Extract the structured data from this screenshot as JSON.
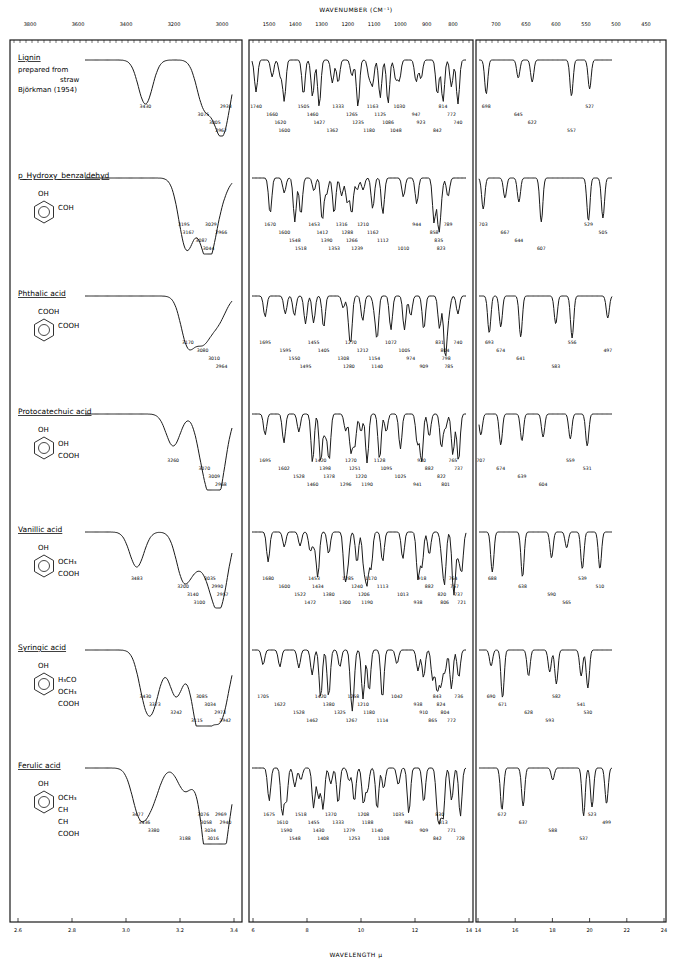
{
  "header": {
    "top_axis_title": "WAVENUMBER (CM⁻¹)",
    "bottom_axis_title": "WAVELENGTH μ"
  },
  "colors": {
    "ink": "#1a1a1a",
    "paper": "#ffffff"
  },
  "chart_data": {
    "type": "line",
    "xlabel": "WAVELENGTH μ",
    "x2label": "WAVENUMBER (CM⁻¹)",
    "ylabel": "",
    "grid": false,
    "legend": "none",
    "panels": [
      {
        "id": "p1",
        "xrange_um": [
          2.4,
          3.45
        ],
        "bottom_ticks": [
          "2.6",
          "2.8",
          "3.0",
          "3.2",
          "3.4"
        ],
        "top_ticks": [
          "3800",
          "3600",
          "3400",
          "3200",
          "3000"
        ]
      },
      {
        "id": "p2",
        "xrange_um": [
          5.6,
          14
        ],
        "bottom_ticks": [
          "6",
          "8",
          "10",
          "12",
          "14"
        ],
        "top_ticks": [
          "1500",
          "1400",
          "1300",
          "1200",
          "1100",
          "1000",
          "900",
          "800"
        ]
      },
      {
        "id": "p3",
        "xrange_um": [
          14,
          24
        ],
        "bottom_ticks": [
          "14",
          "16",
          "18",
          "20",
          "22",
          "24"
        ],
        "top_ticks": [
          "700",
          "650",
          "600",
          "550",
          "500",
          "450"
        ]
      }
    ],
    "series": [
      {
        "name": "Lignin",
        "subtitle": [
          "prepared from",
          "straw",
          "Björkman  (1954)"
        ],
        "formula": [],
        "peaks_p1": [
          3430,
          3075,
          3005,
          2967,
          2938
        ],
        "peaks_p2": [
          1740,
          1660,
          1620,
          1600,
          1505,
          1460,
          1427,
          1362,
          1333,
          1265,
          1235,
          1180,
          1163,
          1125,
          1086,
          1048,
          1030,
          947,
          923,
          842,
          814,
          772,
          740
        ],
        "peaks_p3": [
          698,
          645,
          622,
          557,
          527
        ]
      },
      {
        "name": "p_Hydroxy_benzaldehyd",
        "formula": [
          "OH",
          "COH"
        ],
        "peaks_p1": [
          3195,
          3167,
          3087,
          3044,
          3029,
          2966
        ],
        "peaks_p2": [
          1670,
          1600,
          1548,
          1518,
          1453,
          1412,
          1390,
          1353,
          1316,
          1288,
          1266,
          1239,
          1210,
          1162,
          1112,
          1010,
          944,
          858,
          835,
          823,
          789
        ],
        "peaks_p3": [
          703,
          667,
          644,
          607,
          529,
          505
        ]
      },
      {
        "name": "Phthalic acid",
        "formula": [
          "COOH",
          "COOH"
        ],
        "peaks_p1": [
          3170,
          3080,
          3010,
          2964
        ],
        "peaks_p2": [
          1695,
          1595,
          1550,
          1495,
          1455,
          1405,
          1308,
          1280,
          1270,
          1212,
          1154,
          1140,
          1072,
          1005,
          974,
          909,
          831,
          804,
          798,
          785,
          740
        ],
        "peaks_p3": [
          693,
          674,
          641,
          583,
          556,
          497
        ]
      },
      {
        "name": "Protocatechuic acid",
        "formula": [
          "OH",
          "OH",
          "COOH"
        ],
        "peaks_p1": [
          3260,
          3070,
          3009,
          2968
        ],
        "peaks_p2": [
          1695,
          1602,
          1528,
          1460,
          1420,
          1398,
          1378,
          1296,
          1270,
          1251,
          1220,
          1190,
          1128,
          1095,
          1025,
          941,
          920,
          882,
          822,
          801,
          765,
          737
        ],
        "peaks_p3": [
          707,
          674,
          639,
          604,
          559,
          531
        ]
      },
      {
        "name": "Vanillic acid",
        "formula": [
          "OH",
          "OCH₃",
          "COOH"
        ],
        "peaks_p1": [
          3483,
          3200,
          3140,
          3100,
          3035,
          2990,
          2957
        ],
        "peaks_p2": [
          1680,
          1600,
          1522,
          1472,
          1453,
          1434,
          1380,
          1300,
          1285,
          1240,
          1206,
          1190,
          1170,
          1113,
          1013,
          938,
          918,
          882,
          820,
          806,
          764,
          757,
          737,
          721
        ],
        "peaks_p3": [
          688,
          638,
          590,
          565,
          539,
          510
        ]
      },
      {
        "name": "Syringic acid",
        "formula": [
          "OH",
          "H₃CO",
          "OCH₃",
          "COOH"
        ],
        "peaks_p1": [
          3430,
          3373,
          3242,
          3115,
          3085,
          3034,
          2973,
          2942
        ],
        "peaks_p2": [
          1705,
          1622,
          1528,
          1462,
          1420,
          1380,
          1325,
          1267,
          1258,
          1210,
          1180,
          1114,
          1042,
          938,
          910,
          865,
          843,
          824,
          804,
          772,
          736
        ],
        "peaks_p3": [
          690,
          671,
          628,
          593,
          582,
          541,
          530
        ]
      },
      {
        "name": "Ferulic acid",
        "formula": [
          "OH",
          "OCH₃",
          "CH",
          "CH",
          "COOH"
        ],
        "peaks_p1": [
          3477,
          3436,
          3380,
          3188,
          3076,
          3058,
          3034,
          3016,
          2969,
          2940
        ],
        "peaks_p2": [
          1675,
          1610,
          1590,
          1548,
          1518,
          1455,
          1430,
          1408,
          1370,
          1333,
          1279,
          1253,
          1208,
          1188,
          1140,
          1108,
          1035,
          983,
          909,
          842,
          830,
          813,
          771,
          728
        ],
        "peaks_p3": [
          672,
          637,
          588,
          537,
          523,
          499
        ]
      }
    ]
  }
}
